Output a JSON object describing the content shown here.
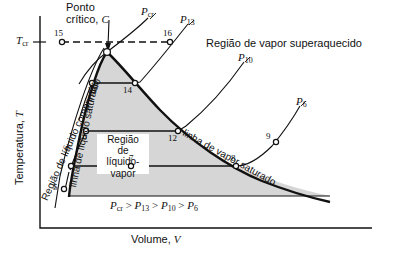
{
  "figure": {
    "type": "thermodynamic-T-v-diagram",
    "language": "pt-BR",
    "axes": {
      "y_label_text": "Temperatura, ",
      "y_label_symbol": "T",
      "x_label_text": "Volume, ",
      "x_label_symbol": "V",
      "y_tick_symbol": "T",
      "y_tick_sub": "cr"
    },
    "annotations": {
      "critical_point_line1": "Ponto",
      "critical_point_line2": "crítico, ",
      "critical_point_symbol": "C",
      "superheated_region": "Região de vapor superaquecido",
      "compressed_liquid_region": "Região de líquido comprimido",
      "saturated_liquid_line": "linha de líquido saturado",
      "saturated_vapor_line": "linha de vapor saturado",
      "mixture_region_l1": "Região",
      "mixture_region_l2": "de",
      "mixture_region_l3": "líquido-",
      "mixture_region_l4": "vapor"
    },
    "isobars": [
      {
        "name": "P-cr-label",
        "symbol": "P",
        "sub": "cr",
        "x": 141,
        "y": 6
      },
      {
        "name": "P-13-label",
        "symbol": "P",
        "sub": "13",
        "x": 180,
        "y": 14
      },
      {
        "name": "P-10-label",
        "symbol": "P",
        "sub": "10",
        "x": 238,
        "y": 52
      },
      {
        "name": "P-6-label",
        "symbol": "P",
        "sub": "6",
        "x": 296,
        "y": 96
      }
    ],
    "pressure_inequality": {
      "terms": [
        "cr",
        "13",
        "10",
        "6"
      ],
      "symbol": "P",
      "operator": ">",
      "text": "Pcr > P13 > P10 > P6"
    },
    "state_points": [
      {
        "label": "15",
        "x": 62,
        "y": 42,
        "num_x": 54,
        "num_y": 29
      },
      {
        "label": "16",
        "x": 170,
        "y": 42,
        "num_x": 163,
        "num_y": 29
      },
      {
        "label": "13",
        "x": 92,
        "y": 83,
        "num_x": 87,
        "num_y": 86
      },
      {
        "label": "14",
        "x": 135,
        "y": 83,
        "num_x": 123,
        "num_y": 86
      },
      {
        "label": "10",
        "x": 86,
        "y": 131,
        "num_x": 78,
        "num_y": 133
      },
      {
        "label": "12",
        "x": 178,
        "y": 131,
        "num_x": 168,
        "num_y": 134
      },
      {
        "label": "7",
        "x": 131,
        "y": 166,
        "num_x": 129,
        "num_y": 155
      },
      {
        "label": "8",
        "x": 236,
        "y": 166,
        "num_x": 231,
        "num_y": 155
      },
      {
        "label": "9",
        "x": 276,
        "y": 142,
        "num_x": 266,
        "num_y": 134
      },
      {
        "label": "6",
        "x": 71,
        "y": 166,
        "num_x": 64,
        "num_y": 150
      },
      {
        "label": "5",
        "x": 64,
        "y": 189,
        "num_x": 54,
        "num_y": 185
      }
    ],
    "colors": {
      "ink": "#111111",
      "dome_fill": "#d6d6d6",
      "background": "#ffffff",
      "mixture_label_box": "#ffffff"
    }
  }
}
